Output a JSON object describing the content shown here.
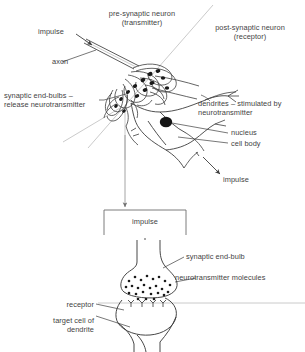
{
  "figure": {
    "type": "biological-diagram",
    "colors": {
      "ink": "#3d3d3d",
      "guide_line": "#b0b0b0",
      "nucleus_fill": "#151515",
      "background": "#ffffff"
    }
  },
  "upper_panel": {
    "name": "neuron-overview",
    "labels": {
      "pre_synaptic": "pre-synaptic neuron\n(transmitter)",
      "post_synaptic": "post-synaptic neuron\n(receptor)",
      "impulse_in": "impulse",
      "axon": "axon",
      "end_bulbs": "synaptic end-bulbs –\nrelease neurotransmitter",
      "dendrites": "dendrites – stimulated by\nneurotransmitter",
      "nucleus": "nucleus",
      "cell_body": "cell body",
      "impulse_out": "impulse"
    }
  },
  "lower_panel": {
    "name": "synapse-detail",
    "labels": {
      "impulse": "impulse",
      "synaptic_end_bulb": "synaptic end-bulb",
      "neurotransmitter_molecules": "neurotransmitter molecules",
      "receptor": "receptor",
      "target_cell": "target cell of\ndendrite"
    }
  }
}
